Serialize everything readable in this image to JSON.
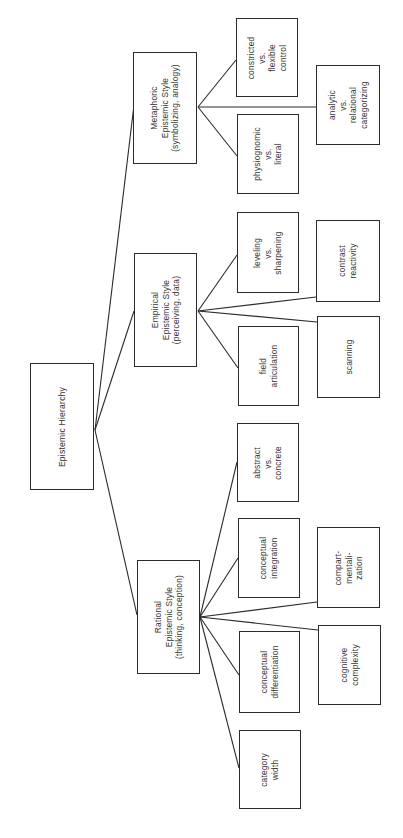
{
  "diagram": {
    "orientation": "rotated-90-ccw",
    "root": {
      "label": "Epistemic Hierarchy",
      "box": [
        30,
        363,
        64,
        127
      ],
      "anchor": [
        95,
        430
      ]
    },
    "branches": [
      {
        "id": "metaphoric",
        "label": "Metaphoric\nEpistemic Style\n(symbolizing, analogy)",
        "box": [
          133,
          52,
          64,
          112
        ],
        "in": [
          134,
          105
        ],
        "out": [
          198,
          107
        ],
        "children": [
          {
            "id": "constricted-flexible-control",
            "label": "constricted\nvs.\nflexible\ncontrol",
            "box": [
              236,
              18,
              62,
              79
            ],
            "in": [
              236,
              60
            ]
          },
          {
            "id": "physiognomic-literal",
            "label": "physiognomic\nvs.\nliteral",
            "box": [
              237,
              114,
              62,
              80
            ],
            "in": [
              237,
              156
            ]
          },
          {
            "id": "analytic-relational-categorizing",
            "label": "analytic\nvs.\nrelational\ncategorizing",
            "box": [
              316,
              65,
              64,
              80
            ],
            "in": [
              316,
              107
            ]
          }
        ]
      },
      {
        "id": "empirical",
        "label": "Empirical\nEpistemic Style\n(perceiving, data)",
        "box": [
          134,
          253,
          63,
          114
        ],
        "in": [
          134,
          311
        ],
        "out": [
          198,
          311
        ],
        "children": [
          {
            "id": "leveling-sharpening",
            "label": "leveling\nvs.\nsharpening",
            "box": [
              237,
              212,
              62,
              81
            ],
            "in": [
              237,
              255
            ]
          },
          {
            "id": "field-articulation",
            "label": "field\narticulation",
            "box": [
              238,
              326,
              61,
              80
            ],
            "in": [
              238,
              368
            ]
          },
          {
            "id": "contrast-reactivity",
            "label": "contrast\nreactivity",
            "box": [
              316,
              220,
              64,
              82
            ],
            "in": [
              316,
              297
            ]
          },
          {
            "id": "scanning",
            "label": "scanning",
            "box": [
              317,
              316,
              63,
              82
            ],
            "in": [
              317,
              322
            ]
          }
        ]
      },
      {
        "id": "rational",
        "label": "Rational\nEpistemic Style\n(thinking, conception)",
        "box": [
          137,
          560,
          63,
          114
        ],
        "in": [
          137,
          615
        ],
        "out": [
          200,
          617
        ],
        "children": [
          {
            "id": "abstract-concrete",
            "label": "abstract\nvs.\nconcrete",
            "box": [
              237,
              423,
              62,
              79
            ],
            "in": [
              237,
              462
            ]
          },
          {
            "id": "conceptual-integration",
            "label": "conceptual\nintegration",
            "box": [
              238,
              518,
              62,
              80
            ],
            "in": [
              238,
              558
            ]
          },
          {
            "id": "compartmentalization",
            "label": "compart-\nmentali-\nzation",
            "box": [
              317,
              527,
              63,
              81
            ],
            "in": [
              317,
              602
            ]
          },
          {
            "id": "conceptual-differentiation",
            "label": "conceptual\ndifferentiation",
            "box": [
              239,
              631,
              61,
              82
            ],
            "in": [
              239,
              675
            ]
          },
          {
            "id": "cognitive-complexity",
            "label": "cognitive\ncomplexity",
            "box": [
              318,
              625,
              63,
              80
            ],
            "in": [
              318,
              630
            ]
          },
          {
            "id": "category-width",
            "label": "category\nwidth",
            "box": [
              239,
              730,
              62,
              79
            ],
            "in": [
              239,
              768
            ]
          }
        ]
      }
    ]
  },
  "colors": {
    "line": "#2b2b2b",
    "text": "#333333",
    "background": "#ffffff"
  }
}
